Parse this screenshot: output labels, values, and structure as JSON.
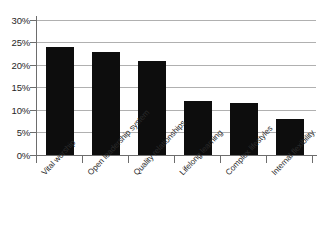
{
  "chart_data": {
    "type": "bar",
    "title": "",
    "subtitle": "",
    "xlabel": "",
    "ylabel": "",
    "categories": [
      "Vital worship",
      "Open leadership system",
      "Quality relationships",
      "Lifelong learning",
      "Complex lifestyles",
      "Internal flexibility"
    ],
    "values": [
      24,
      23,
      21,
      12,
      11.5,
      8
    ],
    "value_labels": [
      "24%",
      "23%",
      "21%",
      "12%",
      "11.5%",
      "8%"
    ],
    "ylim": [
      0,
      30
    ],
    "ytick_values": [
      0,
      5,
      10,
      15,
      20,
      25,
      30
    ],
    "ytick_labels": [
      "0%",
      "5%",
      "10%",
      "15%",
      "20%",
      "25%",
      "30%"
    ],
    "grid": true,
    "grid_axis": "y",
    "legend": false,
    "legend_position": "none",
    "bar_color": "#0d0d0d",
    "grid_color": "#b0b0b0",
    "axis_color": "#6d6d6d",
    "text_color": "#262626",
    "background_color": "#ffffff",
    "xlabel_rotation": -47
  }
}
